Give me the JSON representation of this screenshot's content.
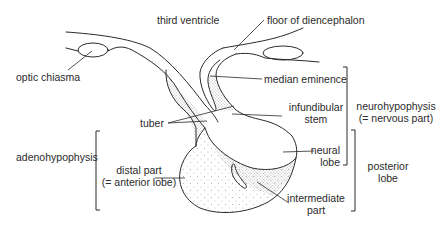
{
  "diagram": {
    "colors": {
      "line": "#2a2a2a",
      "stipple": "#555555",
      "background": "#ffffff"
    },
    "labels": {
      "third_ventricle": "third ventricle",
      "floor_of_diencephalon": "floor of diencephalon",
      "optic_chiasma": "optic chiasma",
      "median_eminence": "median eminence",
      "infundibular_stem_line1": "infundibular",
      "infundibular_stem_line2": "stem",
      "tuber": "tuber",
      "neurohypophysis_line1": "neurohypophysis",
      "neurohypophysis_line2": "(= nervous part)",
      "adenohypophysis": "adenohypophysis",
      "distal_part_line1": "distal part",
      "distal_part_line2": "(= anterior lobe)",
      "neural_lobe_line1": "neural",
      "neural_lobe_line2": "lobe",
      "posterior_lobe_line1": "posterior",
      "posterior_lobe_line2": "lobe",
      "intermediate_part_line1": "intermediate",
      "intermediate_part_line2": "part"
    },
    "brackets": [
      {
        "name": "neurohypophysis",
        "spans": [
          "median eminence",
          "infundibular stem",
          "neural lobe"
        ]
      },
      {
        "name": "posterior lobe",
        "spans": [
          "neural lobe",
          "intermediate part"
        ]
      },
      {
        "name": "adenohypophysis",
        "spans": [
          "tuber",
          "distal part"
        ]
      }
    ]
  }
}
